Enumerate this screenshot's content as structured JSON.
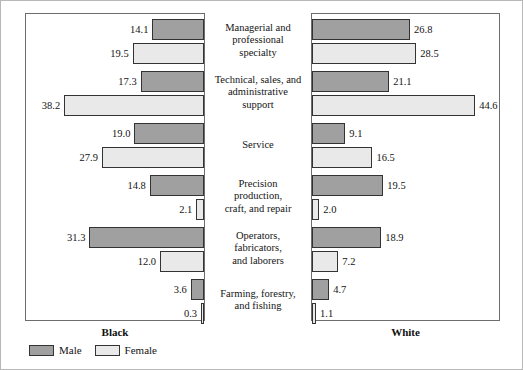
{
  "chart_data": {
    "type": "bar",
    "title": "",
    "subtitle": "",
    "xlabel": "",
    "ylabel": "",
    "orientation": "horizontal",
    "layout": "back-to-back mirrored panels",
    "grid": false,
    "legend_position": "bottom-left",
    "xlim": [
      0,
      50
    ],
    "categories": [
      "Managerial and professional specialty",
      "Technical, sales, and administrative support",
      "Service",
      "Precision production, craft, and repair",
      "Operators, fabricators, and laborers",
      "Farming, forestry, and fishing"
    ],
    "panels": [
      {
        "name": "Black",
        "side": "left",
        "series": [
          {
            "name": "Male",
            "values": [
              14.1,
              17.3,
              19.0,
              14.8,
              31.3,
              3.6
            ]
          },
          {
            "name": "Female",
            "values": [
              19.5,
              38.2,
              27.9,
              2.1,
              12.0,
              0.3
            ]
          }
        ]
      },
      {
        "name": "White",
        "side": "right",
        "series": [
          {
            "name": "Male",
            "values": [
              26.8,
              21.1,
              9.1,
              19.5,
              18.9,
              4.7
            ]
          },
          {
            "name": "Female",
            "values": [
              28.5,
              44.6,
              16.5,
              2.0,
              7.2,
              1.1
            ]
          }
        ]
      }
    ],
    "legend": [
      {
        "label": "Male",
        "color": "#a0a0a0"
      },
      {
        "label": "Female",
        "color": "#e9e9e9"
      }
    ]
  },
  "categories_display": [
    {
      "lines": [
        "Managerial and",
        "professional",
        "specialty"
      ]
    },
    {
      "lines": [
        "Technical, sales, and",
        "administrative",
        "support"
      ]
    },
    {
      "lines": [
        "Service"
      ]
    },
    {
      "lines": [
        "Precision",
        "production,",
        "craft, and repair"
      ]
    },
    {
      "lines": [
        "Operators,",
        "fabricators,",
        "and laborers"
      ]
    },
    {
      "lines": [
        "Farming, forestry,",
        "and fishing"
      ]
    }
  ],
  "left_panel": {
    "group_label": "Black",
    "bars": [
      {
        "series": "Male",
        "value": 14.1,
        "label": "14.1"
      },
      {
        "series": "Female",
        "value": 19.5,
        "label": "19.5"
      },
      {
        "series": "Male",
        "value": 17.3,
        "label": "17.3"
      },
      {
        "series": "Female",
        "value": 38.2,
        "label": "38.2"
      },
      {
        "series": "Male",
        "value": 19.0,
        "label": "19.0"
      },
      {
        "series": "Female",
        "value": 27.9,
        "label": "27.9"
      },
      {
        "series": "Male",
        "value": 14.8,
        "label": "14.8"
      },
      {
        "series": "Female",
        "value": 2.1,
        "label": "2.1"
      },
      {
        "series": "Male",
        "value": 31.3,
        "label": "31.3"
      },
      {
        "series": "Female",
        "value": 12.0,
        "label": "12.0"
      },
      {
        "series": "Male",
        "value": 3.6,
        "label": "3.6"
      },
      {
        "series": "Female",
        "value": 0.3,
        "label": "0.3"
      }
    ]
  },
  "right_panel": {
    "group_label": "White",
    "bars": [
      {
        "series": "Male",
        "value": 26.8,
        "label": "26.8"
      },
      {
        "series": "Female",
        "value": 28.5,
        "label": "28.5"
      },
      {
        "series": "Male",
        "value": 21.1,
        "label": "21.1"
      },
      {
        "series": "Female",
        "value": 44.6,
        "label": "44.6"
      },
      {
        "series": "Male",
        "value": 9.1,
        "label": "9.1"
      },
      {
        "series": "Female",
        "value": 16.5,
        "label": "16.5"
      },
      {
        "series": "Male",
        "value": 19.5,
        "label": "19.5"
      },
      {
        "series": "Female",
        "value": 2.0,
        "label": "2.0"
      },
      {
        "series": "Male",
        "value": 18.9,
        "label": "18.9"
      },
      {
        "series": "Female",
        "value": 7.2,
        "label": "7.2"
      },
      {
        "series": "Male",
        "value": 4.7,
        "label": "4.7"
      },
      {
        "series": "Female",
        "value": 1.1,
        "label": "1.1"
      }
    ]
  },
  "legend": {
    "items": [
      {
        "label": "Male",
        "color": "#a0a0a0"
      },
      {
        "label": "Female",
        "color": "#e9e9e9"
      }
    ]
  },
  "render": {
    "px_per_unit": 3.66,
    "bar_height": 21,
    "bar_slot_height": 24,
    "first_bar_top": 5,
    "group_gap": 4
  }
}
